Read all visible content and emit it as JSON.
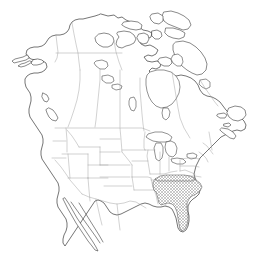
{
  "figure": {
    "type": "range-map",
    "background_color": "#ffffff",
    "width": 274,
    "height": 256,
    "has_labels": false,
    "has_legend": false,
    "has_scale_bar": false,
    "has_border_frame": false
  },
  "styles": {
    "coastline_color": "#3a3a3a",
    "coastline_width": 0.7,
    "subdivision_color": "#9a9a9a",
    "subdivision_width": 0.45,
    "lake_outline_color": "#4a4a4a",
    "range_hatch_color": "#808080",
    "range_outline_color": "#555555",
    "range_pattern": "cross-hatch",
    "land_fill": "#ffffff"
  },
  "landmasses": [
    {
      "name": "mainland-north-america",
      "label": "Mainland North America"
    },
    {
      "name": "alaska",
      "label": "Alaska"
    },
    {
      "name": "baffin-island",
      "label": "Baffin Island"
    },
    {
      "name": "victoria-island",
      "label": "Victoria Island"
    },
    {
      "name": "banks-island",
      "label": "Banks Island"
    },
    {
      "name": "ellesmere-island",
      "label": "Ellesmere Island"
    },
    {
      "name": "newfoundland",
      "label": "Newfoundland"
    },
    {
      "name": "vancouver-island",
      "label": "Vancouver Island"
    },
    {
      "name": "baja-california",
      "label": "Baja California"
    },
    {
      "name": "hudson-bay",
      "label": "Hudson Bay"
    },
    {
      "name": "great-lakes",
      "label": "Great Lakes"
    }
  ],
  "range": {
    "name": "distribution-range",
    "label": "Species distribution range",
    "region": "Southeastern United States",
    "pattern": "cross-hatch",
    "color": "#808080",
    "states_covered": [
      "Mississippi",
      "Alabama",
      "Georgia",
      "South Carolina",
      "North Carolina",
      "Tennessee",
      "Florida"
    ]
  },
  "countries": [
    {
      "name": "canada",
      "label": "Canada"
    },
    {
      "name": "united-states",
      "label": "United States"
    },
    {
      "name": "mexico",
      "label": "Mexico"
    }
  ]
}
